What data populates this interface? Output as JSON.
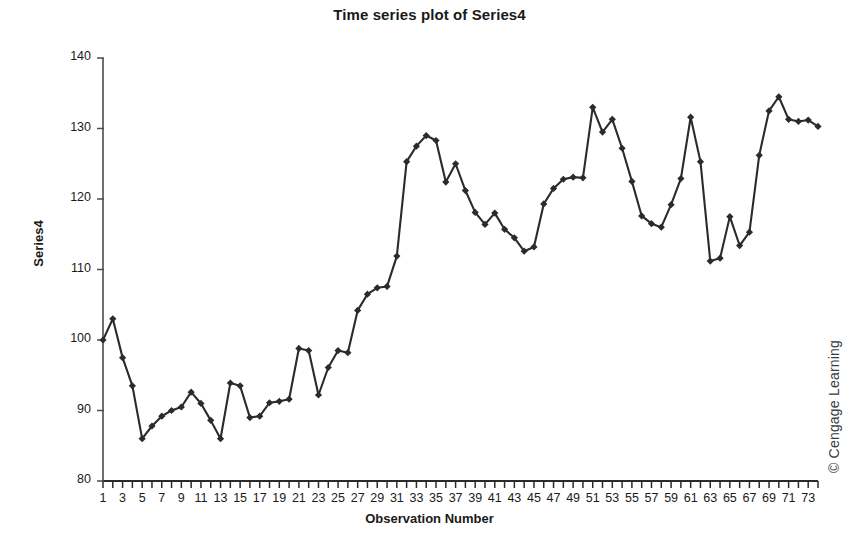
{
  "chart_data": {
    "type": "line",
    "title": "Time series plot of Series4",
    "xlabel": "Observation Number",
    "ylabel": "Series4",
    "ylim": [
      80,
      140
    ],
    "yticks": [
      80,
      90,
      100,
      110,
      120,
      130,
      140
    ],
    "xlim": [
      1,
      74
    ],
    "xticks": [
      1,
      2,
      3,
      4,
      5,
      6,
      7,
      8,
      9,
      10,
      11,
      12,
      13,
      14,
      15,
      16,
      17,
      18,
      19,
      20,
      21,
      22,
      23,
      24,
      25,
      26,
      27,
      28,
      29,
      30,
      31,
      32,
      33,
      34,
      35,
      36,
      37,
      38,
      39,
      40,
      41,
      42,
      43,
      44,
      45,
      46,
      47,
      48,
      49,
      50,
      51,
      52,
      53,
      54,
      55,
      56,
      57,
      58,
      59,
      60,
      61,
      62,
      63,
      64,
      65,
      66,
      67,
      68,
      69,
      70,
      71,
      72,
      73,
      74
    ],
    "xtick_labels": [
      1,
      3,
      5,
      7,
      9,
      11,
      13,
      15,
      17,
      19,
      21,
      23,
      25,
      27,
      29,
      31,
      33,
      35,
      37,
      39,
      41,
      43,
      45,
      47,
      49,
      51,
      53,
      55,
      57,
      59,
      61,
      63,
      65,
      67,
      69,
      71,
      73
    ],
    "grid": false,
    "legend": false,
    "marker": "diamond",
    "series_color": "#2b2b2b",
    "x": [
      1,
      2,
      3,
      4,
      5,
      6,
      7,
      8,
      9,
      10,
      11,
      12,
      13,
      14,
      15,
      16,
      17,
      18,
      19,
      20,
      21,
      22,
      23,
      24,
      25,
      26,
      27,
      28,
      29,
      30,
      31,
      32,
      33,
      34,
      35,
      36,
      37,
      38,
      39,
      40,
      41,
      42,
      43,
      44,
      45,
      46,
      47,
      48,
      49,
      50,
      51,
      52,
      53,
      54,
      55,
      56,
      57,
      58,
      59,
      60,
      61,
      62,
      63,
      64,
      65,
      66,
      67,
      68,
      69,
      70,
      71,
      72,
      73,
      74
    ],
    "values": [
      100.0,
      103.0,
      97.5,
      93.5,
      86.0,
      87.8,
      89.2,
      90.0,
      90.5,
      92.6,
      91.0,
      88.6,
      86.0,
      93.9,
      93.5,
      89.0,
      89.2,
      91.1,
      91.3,
      91.6,
      98.8,
      98.5,
      92.2,
      96.1,
      98.5,
      98.2,
      104.2,
      106.5,
      107.4,
      107.6,
      111.9,
      125.3,
      127.5,
      129.0,
      128.3,
      122.4,
      125.0,
      121.2,
      118.1,
      116.4,
      118.0,
      115.7,
      114.5,
      112.6,
      113.2,
      119.3,
      121.5,
      122.8,
      123.1,
      123.0,
      133.0,
      129.5,
      131.3,
      127.2,
      122.5,
      117.6,
      116.5,
      116.0,
      119.2,
      122.9,
      131.6,
      125.3,
      111.2,
      111.6,
      117.5,
      113.4,
      115.3,
      126.2,
      132.5,
      134.5,
      131.3,
      131.0,
      131.2,
      130.3
    ],
    "series_name": "Series4"
  },
  "credit": {
    "text": "© Cengage Learning"
  }
}
